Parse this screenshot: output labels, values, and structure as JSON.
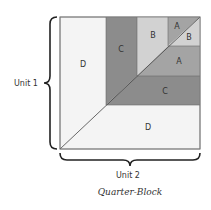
{
  "diagram": {
    "caption": "Quarter-Block",
    "unit_left_label": "Unit 1",
    "unit_bottom_label": "Unit 2",
    "pieces": {
      "d_left": "D",
      "d_bottom": "D",
      "c_vertical": "C",
      "c_horizontal": "C",
      "b_vertical": "B",
      "a_horizontal": "A",
      "a_small": "A",
      "b_small": "B"
    },
    "colors": {
      "D": "#f4f4f4",
      "C": "#8c8c8c",
      "B": "#d2d2d2",
      "A": "#a4a4a4",
      "outline": "#555555"
    }
  }
}
